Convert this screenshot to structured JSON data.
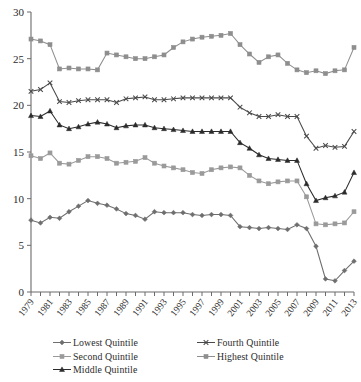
{
  "chart_data": {
    "type": "line",
    "title": "",
    "subtitle": "",
    "xlabel": "",
    "ylabel": "",
    "xlim": [
      1979,
      2013
    ],
    "ylim": [
      0,
      30
    ],
    "yticks": [
      0,
      5,
      10,
      15,
      20,
      25,
      30
    ],
    "grid": false,
    "legend_position": "bottom",
    "x": [
      1979,
      1980,
      1981,
      1982,
      1983,
      1984,
      1985,
      1986,
      1987,
      1988,
      1989,
      1990,
      1991,
      1992,
      1993,
      1994,
      1995,
      1996,
      1997,
      1998,
      1999,
      2000,
      2001,
      2002,
      2003,
      2004,
      2005,
      2006,
      2007,
      2008,
      2009,
      2010,
      2011,
      2012,
      2013
    ],
    "xtick_labels": [
      "1979",
      "1981",
      "1983",
      "1985",
      "1987",
      "1989",
      "1991",
      "1993",
      "1995",
      "1997",
      "1999",
      "2001",
      "2003",
      "2005",
      "2007",
      "2009",
      "2011",
      "2013"
    ],
    "series": [
      {
        "name": "Lowest Quintile",
        "marker": "diamond",
        "color": "#6e6e6e",
        "values": [
          7.7,
          7.4,
          8.0,
          7.9,
          8.6,
          9.2,
          9.8,
          9.5,
          9.3,
          8.9,
          8.4,
          8.2,
          7.8,
          8.6,
          8.5,
          8.5,
          8.5,
          8.3,
          8.2,
          8.3,
          8.3,
          8.2,
          7.0,
          6.9,
          6.8,
          6.9,
          6.8,
          6.7,
          7.2,
          6.8,
          4.9,
          1.4,
          1.2,
          2.3,
          3.3
        ]
      },
      {
        "name": "Second Quintile",
        "marker": "square",
        "color": "#9a9a9a",
        "values": [
          14.6,
          14.3,
          14.9,
          13.8,
          13.7,
          14.1,
          14.5,
          14.5,
          14.3,
          13.8,
          13.9,
          14.0,
          14.4,
          13.8,
          13.5,
          13.3,
          13.1,
          12.8,
          12.7,
          13.1,
          13.3,
          13.4,
          13.3,
          12.5,
          11.9,
          11.6,
          11.8,
          11.9,
          11.9,
          10.2,
          7.3,
          7.2,
          7.3,
          7.4,
          8.6
        ]
      },
      {
        "name": "Middle Quintile",
        "marker": "triangle",
        "color": "#2b2b2b",
        "values": [
          18.9,
          18.8,
          19.4,
          17.9,
          17.5,
          17.7,
          18.0,
          18.2,
          18.0,
          17.6,
          17.8,
          17.9,
          17.9,
          17.6,
          17.5,
          17.4,
          17.3,
          17.2,
          17.2,
          17.2,
          17.2,
          17.2,
          16.0,
          15.4,
          14.7,
          14.3,
          14.2,
          14.1,
          14.1,
          11.6,
          9.8,
          10.1,
          10.3,
          10.7,
          12.8
        ]
      },
      {
        "name": "Fourth Quintile",
        "marker": "cross",
        "color": "#4a4a4a",
        "values": [
          21.5,
          21.7,
          22.4,
          20.4,
          20.3,
          20.5,
          20.6,
          20.6,
          20.6,
          20.3,
          20.7,
          20.8,
          20.9,
          20.6,
          20.6,
          20.7,
          20.8,
          20.8,
          20.8,
          20.8,
          20.8,
          20.8,
          19.8,
          19.2,
          18.8,
          18.8,
          19.0,
          18.8,
          18.8,
          16.7,
          15.4,
          15.7,
          15.5,
          15.6,
          17.2
        ]
      },
      {
        "name": "Highest Quintile",
        "marker": "square",
        "color": "#8e8e8e",
        "values": [
          27.1,
          26.9,
          26.5,
          23.9,
          24.0,
          23.9,
          23.9,
          23.8,
          25.6,
          25.4,
          25.2,
          25.0,
          25.0,
          25.2,
          25.4,
          26.2,
          26.8,
          27.1,
          27.3,
          27.4,
          27.5,
          27.7,
          26.5,
          25.5,
          24.6,
          25.2,
          25.4,
          24.5,
          23.8,
          23.5,
          23.7,
          23.4,
          23.7,
          23.8,
          26.2
        ]
      }
    ]
  },
  "legend": {
    "left_column": [
      "Lowest Quintile",
      "Second Quintile",
      "Middle Quintile"
    ],
    "right_column": [
      "Fourth Quintile",
      "Highest Quintile"
    ]
  },
  "axis": {
    "y_top_label": "30",
    "y_bottom_label": "0"
  }
}
